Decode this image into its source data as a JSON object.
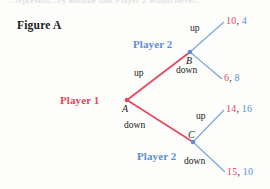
{
  "page": {
    "clipped_top_line": "...represent...by assume that Player 2 would never...",
    "figure_label": "Figure A"
  },
  "tree": {
    "nodes": [
      {
        "id": "A",
        "letter": "A",
        "owner_label": "Player 1",
        "owner_color": "#e8455f",
        "x": 127,
        "y": 100
      },
      {
        "id": "B",
        "letter": "B",
        "owner_label": "Player 2",
        "owner_color": "#5b8fd4",
        "x": 190,
        "y": 52
      },
      {
        "id": "C",
        "letter": "C",
        "owner_label": "Player 2",
        "owner_color": "#5b8fd4",
        "x": 193,
        "y": 142
      }
    ],
    "edges": [
      {
        "from": "A",
        "to": "B",
        "label": "up",
        "color": "#e8455f"
      },
      {
        "from": "A",
        "to": "C",
        "label": "down",
        "color": "#e8455f"
      },
      {
        "from": "B",
        "to": "L1",
        "label": "up",
        "color": "#5b8fd4"
      },
      {
        "from": "B",
        "to": "L2",
        "label": "down",
        "color": "#5b8fd4"
      },
      {
        "from": "C",
        "to": "L3",
        "label": "up",
        "color": "#5b8fd4"
      },
      {
        "from": "C",
        "to": "L4",
        "label": "down",
        "color": "#5b8fd4"
      }
    ],
    "payoffs": [
      {
        "id": "L1",
        "player1": "10",
        "sep": ",",
        "player2": "4"
      },
      {
        "id": "L2",
        "player1": "6",
        "sep": ",",
        "player2": "8"
      },
      {
        "id": "L3",
        "player1": "14",
        "sep": ",",
        "player2": "16"
      },
      {
        "id": "L4",
        "player1": "15",
        "sep": ",",
        "player2": "10"
      }
    ],
    "colors": {
      "player1": "#e8455f",
      "player2": "#5b8fd4",
      "text": "#1b1b1b"
    }
  }
}
